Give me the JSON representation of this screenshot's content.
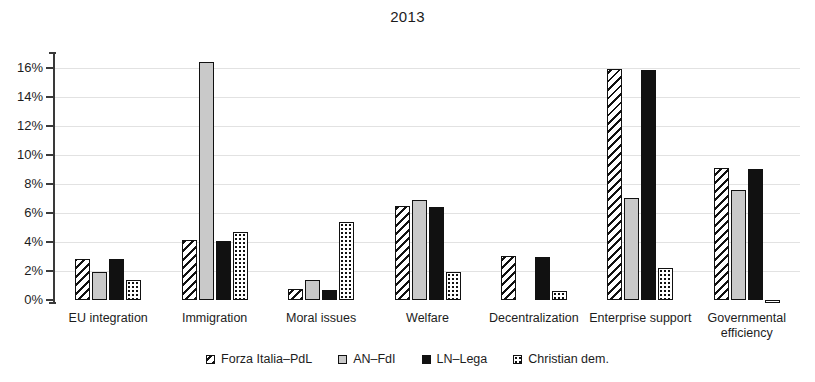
{
  "chart_data": {
    "type": "bar",
    "title": "2013",
    "xlabel": "",
    "ylabel": "",
    "ylim": [
      0,
      16.8
    ],
    "ytick_values": [
      0,
      2,
      4,
      6,
      8,
      10,
      12,
      14,
      16
    ],
    "ytick_labels": [
      "0%",
      "2%",
      "4%",
      "6%",
      "8%",
      "10%",
      "12%",
      "14%",
      "16%"
    ],
    "grid": true,
    "legend_position": "bottom",
    "unit": "%",
    "categories": [
      "EU integration",
      "Immigration",
      "Moral issues",
      "Welfare",
      "Decentralization",
      "Enterprise support",
      "Governmental efficiency"
    ],
    "series": [
      {
        "name": "Forza Italia–PdL",
        "pattern": "diagonal-hatch",
        "values": [
          2.85,
          4.1,
          0.75,
          6.45,
          3.05,
          15.9,
          9.1
        ]
      },
      {
        "name": "AN–FdI",
        "pattern": "solid-grey",
        "values": [
          1.9,
          16.4,
          1.35,
          6.9,
          0,
          7.0,
          7.55
        ]
      },
      {
        "name": "LN–Lega",
        "pattern": "solid-black",
        "values": [
          2.8,
          4.05,
          0.7,
          6.4,
          2.95,
          15.85,
          9.05
        ]
      },
      {
        "name": "Christian dem.",
        "pattern": "dotted",
        "values": [
          1.4,
          4.65,
          5.35,
          1.9,
          0.65,
          2.2,
          -0.15
        ]
      }
    ]
  },
  "legend": {
    "items": [
      {
        "label": "Forza Italia–PdL",
        "swatch": "swatch-hatched"
      },
      {
        "label": "AN–FdI",
        "swatch": "swatch-grey"
      },
      {
        "label": "LN–Lega",
        "swatch": "swatch-black"
      },
      {
        "label": "Christian dem.",
        "swatch": "swatch-dotted"
      }
    ]
  },
  "colors": {
    "background": "#ffffff",
    "axis": "#3a3a3a",
    "grid": "#e2e2e2",
    "text": "#1c1c1c",
    "series_grey": "#c9c9c9",
    "series_black": "#111111"
  }
}
